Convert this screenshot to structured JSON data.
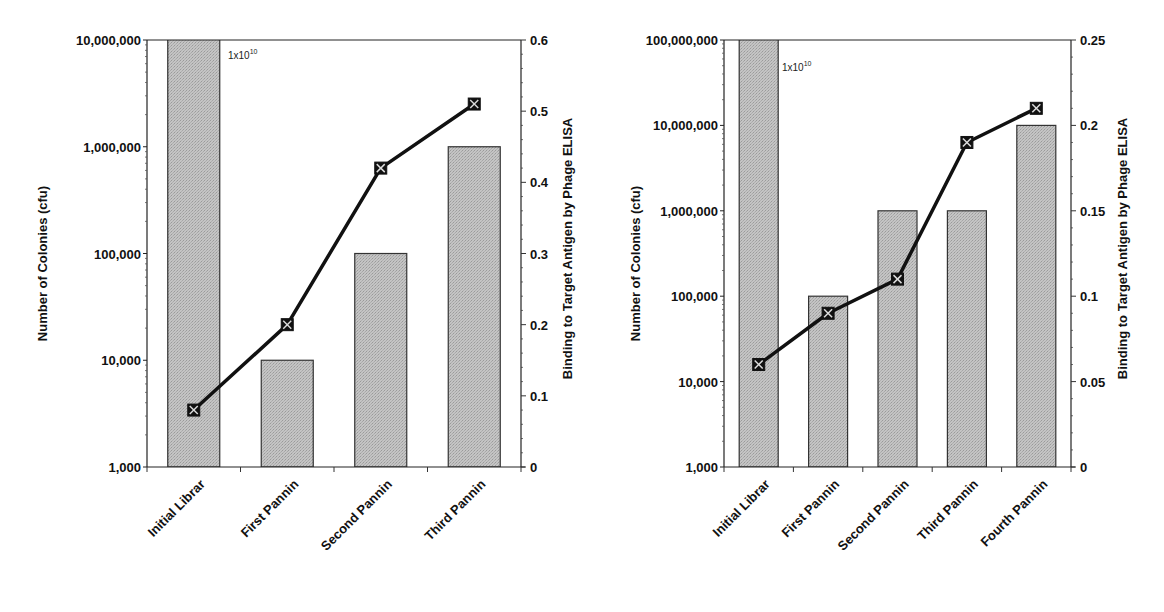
{
  "chart_data": [
    {
      "type": "bar",
      "title": "",
      "categories": [
        "Initial Library",
        "First Panning",
        "Second Panning",
        "Third Panning"
      ],
      "xlabel": "",
      "ylabel": "Number of Colonies (cfu)",
      "y2label": "Binding to Target Antigen by Phage ELISA",
      "yscale": "log",
      "ylim": [
        1000,
        10000000
      ],
      "y_ticks": [
        "1,000",
        "10,000",
        "100,000",
        "1,000,000",
        "10,000,000"
      ],
      "y2lim": [
        0,
        0.6
      ],
      "y2_ticks": [
        "0",
        "0.1",
        "0.2",
        "0.3",
        "0.4",
        "0.5",
        "0.6"
      ],
      "annotation": {
        "text": "1x10",
        "superscript": "10"
      },
      "grid": false,
      "series": [
        {
          "name": "Number of Colonies (cfu)",
          "type": "bar",
          "axis": "left",
          "values": [
            10000000000,
            10000,
            100000,
            1000000
          ]
        },
        {
          "name": "Binding to Target Antigen by Phage ELISA",
          "type": "line",
          "axis": "right",
          "values": [
            0.08,
            0.2,
            0.42,
            0.51
          ]
        }
      ]
    },
    {
      "type": "bar",
      "title": "",
      "categories": [
        "Initial Library",
        "First Panning",
        "Second Panning",
        "Third Panning",
        "Fourth Panning"
      ],
      "xlabel": "",
      "ylabel": "Number of Colonies (cfu)",
      "y2label": "Binding to Target Antigen by Phage ELISA",
      "yscale": "log",
      "ylim": [
        1000,
        100000000
      ],
      "y_ticks": [
        "1,000",
        "10,000",
        "100,000",
        "1,000,000",
        "10,000,000",
        "100,000,000"
      ],
      "y2lim": [
        0,
        0.25
      ],
      "y2_ticks": [
        "0",
        "0.05",
        "0.1",
        "0.15",
        "0.2",
        "0.25"
      ],
      "annotation": {
        "text": "1x10",
        "superscript": "10"
      },
      "grid": false,
      "series": [
        {
          "name": "Number of Colonies (cfu)",
          "type": "bar",
          "axis": "left",
          "values": [
            10000000000,
            100000,
            1000000,
            1000000,
            10000000
          ]
        },
        {
          "name": "Binding to Target Antigen by Phage ELISA",
          "type": "line",
          "axis": "right",
          "values": [
            0.06,
            0.09,
            0.11,
            0.19,
            0.21
          ]
        }
      ]
    }
  ],
  "charts": [
    {
      "ylabel": "Number of Colonies (cfu)",
      "y2label": "Binding to Target Antigen by Phage ELISA",
      "annotation": "1x10",
      "annotation_sup": "10",
      "categories": [
        "Initial Library",
        "First Panning",
        "Second Panning",
        "Third Panning"
      ]
    },
    {
      "ylabel": "Number of Colonies (cfu)",
      "y2label": "Binding to Target Antigen by Phage ELISA",
      "annotation": "1x10",
      "annotation_sup": "10",
      "categories": [
        "Initial Library",
        "First Panning",
        "Second Panning",
        "Third Panning",
        "Fourth Panning"
      ]
    }
  ],
  "colors": {
    "bar_fill": "#bdbdbd",
    "line": "#111111",
    "axis": "#222222"
  }
}
